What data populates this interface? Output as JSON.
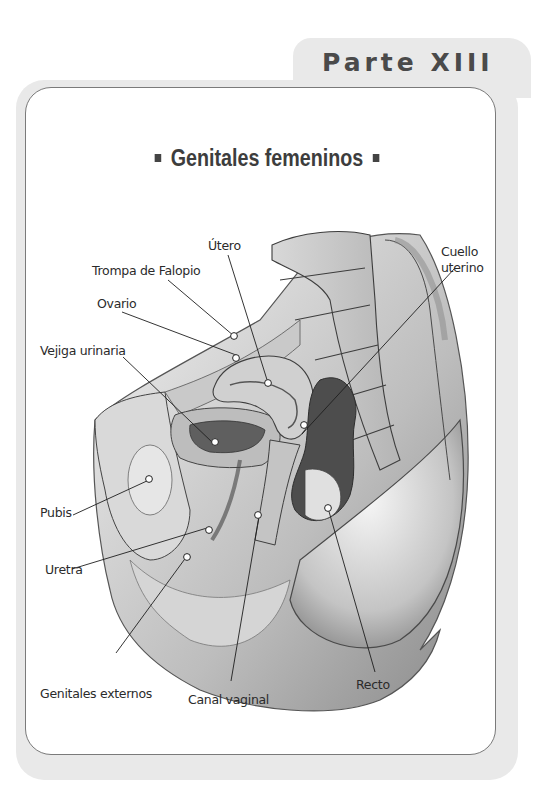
{
  "page": {
    "part_label": "Parte XIII",
    "heading": "Genitales femeninos",
    "heading_bullet": "■"
  },
  "figure": {
    "labels": [
      {
        "id": "utero",
        "text": "Útero"
      },
      {
        "id": "trompa",
        "text": "Trompa de Falopio"
      },
      {
        "id": "ovario",
        "text": "Ovario"
      },
      {
        "id": "vejiga",
        "text": "Vejiga urinaria"
      },
      {
        "id": "cuello_1",
        "text": "Cuello"
      },
      {
        "id": "cuello_2",
        "text": "uterino"
      },
      {
        "id": "pubis",
        "text": "Pubis"
      },
      {
        "id": "uretra",
        "text": "Uretra"
      },
      {
        "id": "genitales",
        "text": "Genitales externos"
      },
      {
        "id": "canal",
        "text": "Canal vaginal"
      },
      {
        "id": "recto",
        "text": "Recto"
      }
    ]
  },
  "colors": {
    "frame": "#e9e9e9",
    "border": "#7a7a7a",
    "title_text": "#4a4a4a"
  }
}
